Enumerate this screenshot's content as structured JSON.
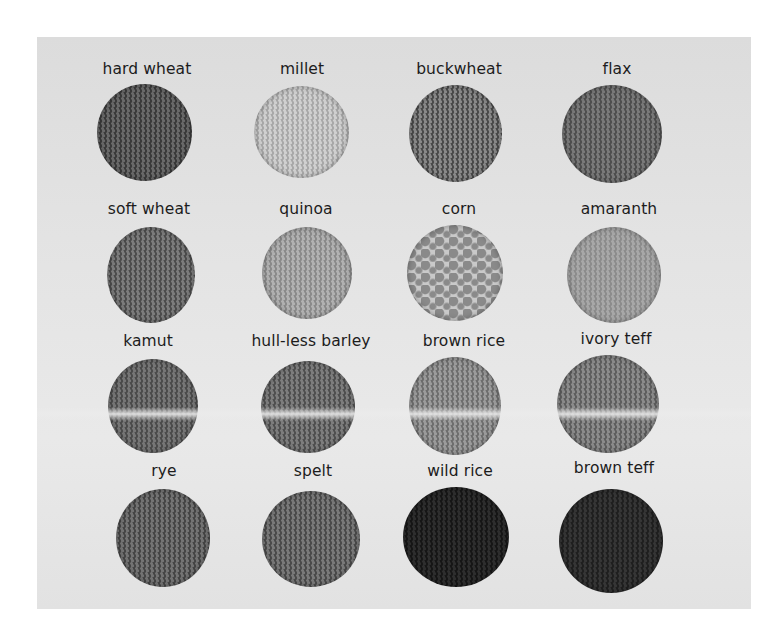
{
  "image": {
    "description": "Sixteen grain samples arranged in a 4x4 grid on a light gray background, each labeled above",
    "background": "#e3e3e3"
  },
  "grains": [
    {
      "label": "hard wheat",
      "row": 0,
      "col": 0,
      "tone": "#3a3a3a",
      "speck": "#6a6a6a"
    },
    {
      "label": "millet",
      "row": 0,
      "col": 1,
      "tone": "#a8a8a8",
      "speck": "#d0d0d0"
    },
    {
      "label": "buckwheat",
      "row": 0,
      "col": 2,
      "tone": "#4a4a4a",
      "speck": "#8a8a8a"
    },
    {
      "label": "flax",
      "row": 0,
      "col": 3,
      "tone": "#4e4e4e",
      "speck": "#7a7a7a"
    },
    {
      "label": "soft wheat",
      "row": 1,
      "col": 0,
      "tone": "#4c4c4c",
      "speck": "#7d7d7d"
    },
    {
      "label": "quinoa",
      "row": 1,
      "col": 1,
      "tone": "#8a8a8a",
      "speck": "#b2b2b2"
    },
    {
      "label": "corn",
      "row": 1,
      "col": 2,
      "tone": "#c9c9c9",
      "speck": "#8a8a8a"
    },
    {
      "label": "amaranth",
      "row": 1,
      "col": 3,
      "tone": "#8c8c8c",
      "speck": "#a8a8a8"
    },
    {
      "label": "kamut",
      "row": 2,
      "col": 0,
      "tone": "#4b4b4b",
      "speck": "#777777"
    },
    {
      "label": "hull-less barley",
      "row": 2,
      "col": 1,
      "tone": "#4f4f4f",
      "speck": "#7e7e7e"
    },
    {
      "label": "brown rice",
      "row": 2,
      "col": 2,
      "tone": "#6e6e6e",
      "speck": "#9c9c9c"
    },
    {
      "label": "ivory teff",
      "row": 2,
      "col": 3,
      "tone": "#5e5e5e",
      "speck": "#8c8c8c"
    },
    {
      "label": "rye",
      "row": 3,
      "col": 0,
      "tone": "#454545",
      "speck": "#747474"
    },
    {
      "label": "spelt",
      "row": 3,
      "col": 1,
      "tone": "#4a4a4a",
      "speck": "#7a7a7a"
    },
    {
      "label": "wild rice",
      "row": 3,
      "col": 2,
      "tone": "#161616",
      "speck": "#2e2e2e"
    },
    {
      "label": "brown teff",
      "row": 3,
      "col": 3,
      "tone": "#1f1f1f",
      "speck": "#363636"
    }
  ]
}
